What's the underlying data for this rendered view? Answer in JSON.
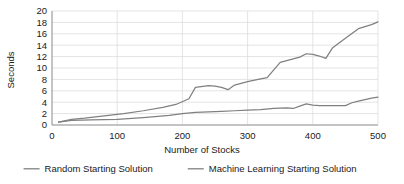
{
  "chart_data": {
    "type": "line",
    "title": "",
    "xlabel": "Number of Stocks",
    "ylabel": "Seconds",
    "xlim": [
      0,
      500
    ],
    "ylim": [
      0,
      20
    ],
    "xticks": [
      0,
      100,
      200,
      300,
      400,
      500
    ],
    "yticks": [
      0,
      2,
      4,
      6,
      8,
      10,
      12,
      14,
      16,
      18,
      20
    ],
    "xtick_labels": [
      "0",
      "100",
      "200",
      "300",
      "400",
      "500"
    ],
    "ytick_labels": [
      "0",
      "2",
      "4",
      "6",
      "8",
      "10",
      "12",
      "14",
      "16",
      "18",
      "20"
    ],
    "grid": true,
    "grid_color": "#d9d9d9",
    "legend_position": "bottom",
    "series": [
      {
        "name": "Random Starting Solution",
        "color": "#808080",
        "x": [
          10,
          30,
          50,
          80,
          110,
          140,
          170,
          190,
          210,
          220,
          240,
          250,
          260,
          270,
          280,
          300,
          320,
          330,
          350,
          360,
          380,
          390,
          400,
          410,
          420,
          430,
          450,
          470,
          490,
          500
        ],
        "y": [
          0.5,
          1.0,
          1.2,
          1.6,
          2.0,
          2.5,
          3.1,
          3.6,
          4.6,
          6.6,
          6.9,
          6.8,
          6.6,
          6.2,
          7.0,
          7.6,
          8.1,
          8.3,
          11.0,
          11.3,
          11.9,
          12.5,
          12.4,
          12.1,
          11.7,
          13.5,
          15.2,
          16.9,
          17.6,
          18.1
        ]
      },
      {
        "name": "Machine Learning Starting Solution",
        "color": "#808080",
        "x": [
          10,
          30,
          60,
          100,
          140,
          180,
          200,
          220,
          240,
          260,
          280,
          300,
          320,
          340,
          360,
          370,
          380,
          390,
          400,
          410,
          430,
          450,
          460,
          470,
          490,
          500
        ],
        "y": [
          0.5,
          0.8,
          0.9,
          1.0,
          1.3,
          1.7,
          2.0,
          2.2,
          2.3,
          2.4,
          2.5,
          2.6,
          2.7,
          2.9,
          3.0,
          2.9,
          3.3,
          3.7,
          3.5,
          3.4,
          3.4,
          3.4,
          3.9,
          4.2,
          4.7,
          4.9
        ]
      }
    ]
  },
  "legend": {
    "items": [
      {
        "label": "Random Starting Solution",
        "swatch": "line-swatch",
        "color": "#808080"
      },
      {
        "label": "Machine Learning Starting Solution",
        "swatch": "line-swatch",
        "color": "#808080"
      }
    ]
  }
}
